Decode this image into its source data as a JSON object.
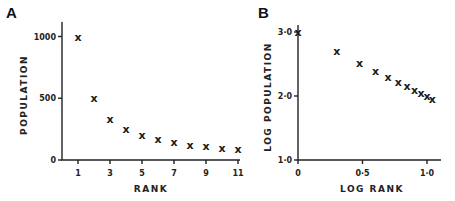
{
  "chart_data": [
    {
      "type": "scatter",
      "panel": "A",
      "title": "",
      "xlabel": "RANK",
      "ylabel": "POPULATION",
      "x_ticks": [
        "1",
        "3",
        "5",
        "7",
        "9",
        "11"
      ],
      "y_ticks": [
        "0",
        "500",
        "1000"
      ],
      "xlim": [
        0,
        11
      ],
      "ylim": [
        0,
        1100
      ],
      "grid": false,
      "marker": "x",
      "x": [
        1,
        2,
        3,
        4,
        5,
        6,
        7,
        8,
        9,
        10,
        11
      ],
      "y": [
        1000,
        500,
        333,
        250,
        200,
        167,
        143,
        125,
        111,
        100,
        91
      ]
    },
    {
      "type": "scatter",
      "panel": "B",
      "title": "",
      "xlabel": "LOG RANK",
      "ylabel": "LOG POPULATION",
      "x_ticks": [
        "0",
        "0·5",
        "1·0"
      ],
      "y_ticks": [
        "1·0",
        "2·0",
        "3·0"
      ],
      "xlim": [
        0,
        1.1
      ],
      "ylim": [
        1.0,
        3.1
      ],
      "grid": false,
      "marker": "x",
      "x": [
        0,
        0.301,
        0.477,
        0.602,
        0.699,
        0.778,
        0.845,
        0.903,
        0.954,
        1.0,
        1.041
      ],
      "y": [
        3.0,
        2.699,
        2.523,
        2.398,
        2.301,
        2.222,
        2.155,
        2.097,
        2.046,
        2.0,
        1.959
      ]
    }
  ],
  "panels": {
    "a": {
      "letter": "A",
      "xlabel": "RANK",
      "ylabel": "POPULATION"
    },
    "b": {
      "letter": "B",
      "xlabel": "LOG RANK",
      "ylabel": "LOG POPULATION"
    }
  },
  "marker_glyph": "x"
}
